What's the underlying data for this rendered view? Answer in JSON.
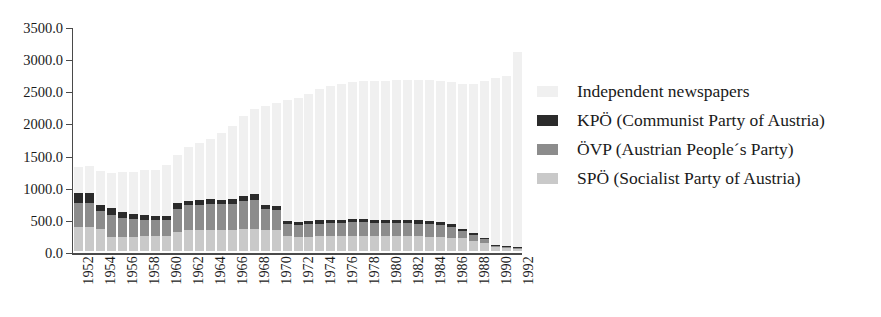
{
  "chart_data": {
    "type": "bar",
    "stacked": true,
    "title": "",
    "subtitle": "",
    "xlabel": "",
    "ylabel": "",
    "ylim": [
      0,
      3500
    ],
    "ytick_labels": [
      "0.0",
      "500.0",
      "1000.0",
      "1500.0",
      "2000.0",
      "2500.0",
      "3000.0",
      "3500.0"
    ],
    "ytick_values": [
      0,
      500,
      1000,
      1500,
      2000,
      2500,
      3000,
      3500
    ],
    "grid": false,
    "legend_position": "right",
    "x": [
      1952,
      1953,
      1954,
      1955,
      1956,
      1957,
      1958,
      1959,
      1960,
      1961,
      1962,
      1963,
      1964,
      1965,
      1966,
      1967,
      1968,
      1969,
      1970,
      1971,
      1972,
      1973,
      1974,
      1975,
      1976,
      1977,
      1978,
      1979,
      1980,
      1981,
      1982,
      1983,
      1984,
      1985,
      1986,
      1987,
      1988,
      1989,
      1990,
      1991,
      1992
    ],
    "xtick_labels": [
      "1952",
      "1954",
      "1956",
      "1958",
      "1960",
      "1962",
      "1964",
      "1966",
      "1968",
      "1970",
      "1972",
      "1974",
      "1976",
      "1978",
      "1980",
      "1982",
      "1984",
      "1986",
      "1988",
      "1990",
      "1992"
    ],
    "stack_order_bottom_to_top": [
      "SPÖ",
      "ÖVP",
      "KPÖ",
      "Independent"
    ],
    "series": [
      {
        "name": "SPÖ (Socialist Party of Austria)",
        "short": "SPÖ",
        "color": "#c9c9c9",
        "values": [
          380,
          380,
          345,
          215,
          225,
          225,
          230,
          235,
          230,
          300,
          320,
          330,
          330,
          330,
          330,
          340,
          350,
          330,
          320,
          230,
          225,
          225,
          230,
          230,
          235,
          240,
          240,
          235,
          235,
          230,
          230,
          230,
          225,
          220,
          210,
          195,
          150,
          120,
          55,
          40,
          38
        ]
      },
      {
        "name": "ÖVP (Austrian People´s Party)",
        "short": "ÖVP",
        "color": "#8c8c8c",
        "values": [
          370,
          370,
          280,
          345,
          290,
          275,
          255,
          250,
          255,
          360,
          390,
          390,
          400,
          395,
          400,
          440,
          450,
          330,
          320,
          185,
          185,
          190,
          195,
          200,
          205,
          205,
          205,
          205,
          205,
          205,
          200,
          195,
          190,
          185,
          170,
          120,
          100,
          65,
          30,
          25,
          22
        ]
      },
      {
        "name": "KPÖ (Communist Party of Austria)",
        "short": "KPÖ",
        "color": "#2b2b2b",
        "values": [
          160,
          155,
          95,
          105,
          95,
          75,
          70,
          65,
          60,
          80,
          75,
          75,
          75,
          75,
          80,
          80,
          80,
          60,
          60,
          45,
          45,
          45,
          50,
          50,
          50,
          50,
          50,
          50,
          50,
          50,
          50,
          50,
          48,
          45,
          40,
          35,
          30,
          25,
          12,
          10,
          10
        ]
      },
      {
        "name": "Independent newspapers",
        "short": "Independent",
        "color": "#f0f0f0",
        "values": [
          390,
          410,
          530,
          545,
          620,
          660,
          700,
          710,
          790,
          760,
          830,
          880,
          930,
          1040,
          1130,
          1240,
          1330,
          1530,
          1600,
          1890,
          1930,
          1990,
          2050,
          2090,
          2110,
          2130,
          2150,
          2160,
          2160,
          2170,
          2180,
          2190,
          2190,
          2200,
          2210,
          2250,
          2320,
          2430,
          2600,
          2650,
          3030
        ]
      }
    ],
    "totals": [
      1300,
      1315,
      1250,
      1210,
      1230,
      1235,
      1255,
      1260,
      1335,
      1500,
      1615,
      1675,
      1735,
      1840,
      1940,
      2100,
      2210,
      2250,
      2300,
      2350,
      2385,
      2450,
      2525,
      2570,
      2600,
      2625,
      2645,
      2650,
      2650,
      2655,
      2660,
      2665,
      2653,
      2650,
      2630,
      2600,
      2600,
      2640,
      2697,
      2725,
      3100
    ]
  },
  "legend": {
    "items": [
      {
        "label": "Independent newspapers",
        "color": "#f0f0f0"
      },
      {
        "label": "KPÖ (Communist Party of Austria)",
        "color": "#2b2b2b"
      },
      {
        "label": "ÖVP (Austrian People´s Party)",
        "color": "#8c8c8c"
      },
      {
        "label": "SPÖ (Socialist Party of Austria)",
        "color": "#c9c9c9"
      }
    ]
  }
}
